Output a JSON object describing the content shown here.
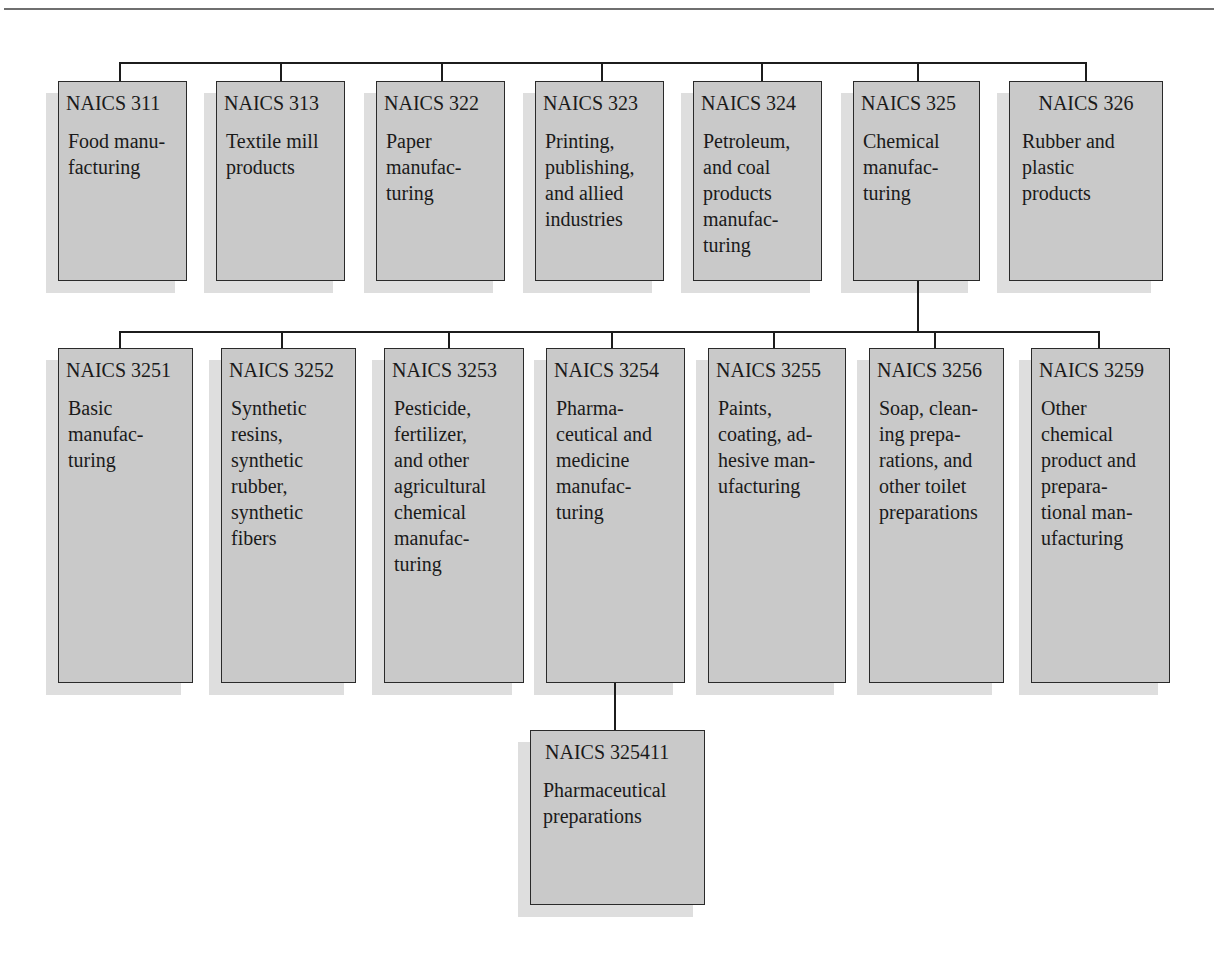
{
  "diagram": {
    "type": "hierarchy",
    "colors": {
      "box_fill": "#c9c9c9",
      "box_border": "#2a2a2a",
      "shadow": "#dedede",
      "connector": "#1c1c1c"
    },
    "level1": [
      {
        "code": "NAICS 311",
        "desc": "Food manu-\nfacturing"
      },
      {
        "code": "NAICS 313",
        "desc": "Textile mill\nproducts"
      },
      {
        "code": "NAICS 322",
        "desc": "Paper\nmanufac-\nturing"
      },
      {
        "code": "NAICS 323",
        "desc": "Printing,\npublishing,\nand allied\nindustries"
      },
      {
        "code": "NAICS 324",
        "desc": "Petroleum,\nand coal\nproducts\nmanufac-\nturing"
      },
      {
        "code": "NAICS 325",
        "desc": "Chemical\nmanufac-\nturing"
      },
      {
        "code": "NAICS 326",
        "desc": "Rubber and\nplastic\nproducts"
      }
    ],
    "level2_parent": "NAICS 325",
    "level2": [
      {
        "code": "NAICS 3251",
        "desc": "Basic\nmanufac-\nturing"
      },
      {
        "code": "NAICS 3252",
        "desc": "Synthetic\nresins,\nsynthetic\nrubber,\nsynthetic\nfibers"
      },
      {
        "code": "NAICS 3253",
        "desc": "Pesticide,\nfertilizer,\nand other\nagricultural\nchemical\nmanufac-\nturing"
      },
      {
        "code": "NAICS 3254",
        "desc": "Pharma-\nceutical and\nmedicine\nmanufac-\nturing"
      },
      {
        "code": "NAICS 3255",
        "desc": "Paints,\ncoating, ad-\nhesive man-\nufacturing"
      },
      {
        "code": "NAICS 3256",
        "desc": "Soap, clean-\ning prepa-\nrations, and\nother toilet\npreparations"
      },
      {
        "code": "NAICS 3259",
        "desc": "Other\nchemical\nproduct and\nprepara-\ntional man-\nufacturing"
      }
    ],
    "level3_parent": "NAICS 3254",
    "level3": [
      {
        "code": "NAICS 325411",
        "desc": "Pharmaceutical\npreparations"
      }
    ]
  }
}
